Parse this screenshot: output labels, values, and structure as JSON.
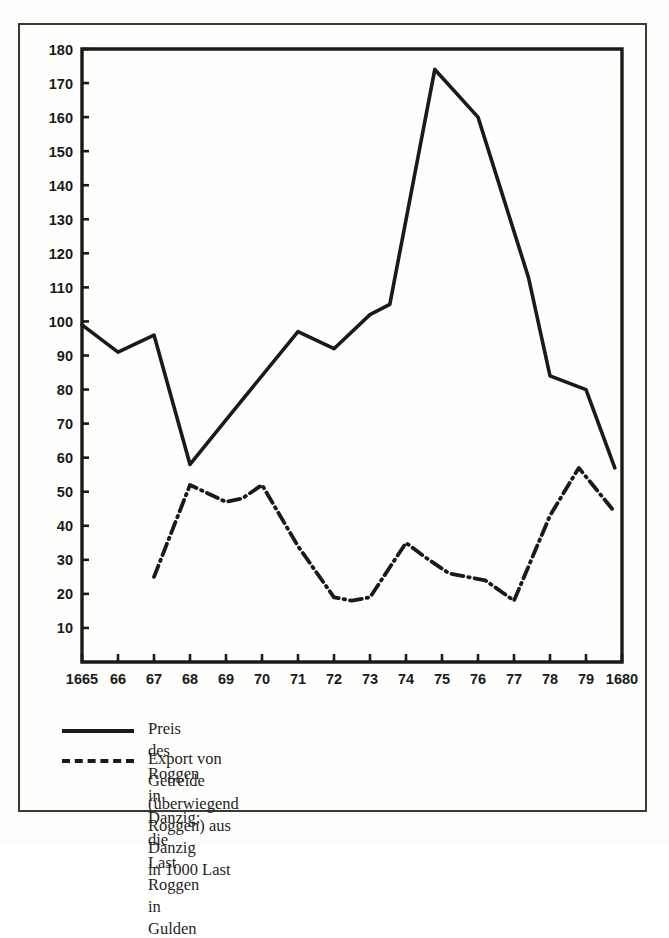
{
  "figure": {
    "background_color": "#fdfdfb",
    "frame_color": "#3a3a36",
    "ink_color": "#1a1a18"
  },
  "legend": {
    "position": "below-axes",
    "entries": [
      {
        "style": "solid",
        "label": "Preis des Roggen in Danzig; die Last Roggen in Gulden"
      },
      {
        "style": "dash-dot",
        "label": "Export von Getreide (überwiegend Roggen) aus Danzig\nin 1000 Last"
      }
    ]
  },
  "chart_data": {
    "type": "line",
    "title": "",
    "subtitle": "",
    "xlabel": "",
    "ylabel": "",
    "grid": false,
    "legend_position": "bottom",
    "xlim": [
      1665,
      1680
    ],
    "ylim": [
      0,
      180
    ],
    "y_ticks": [
      10,
      20,
      30,
      40,
      50,
      60,
      70,
      80,
      90,
      100,
      110,
      120,
      130,
      140,
      150,
      160,
      170,
      180
    ],
    "y_tick_labels": [
      "10",
      "20",
      "30",
      "40",
      "50",
      "60",
      "70",
      "80",
      "90",
      "100",
      "110",
      "120",
      "130",
      "140",
      "150",
      "160",
      "170",
      "180"
    ],
    "x_ticks": [
      1665,
      1666,
      1667,
      1668,
      1669,
      1670,
      1671,
      1672,
      1673,
      1674,
      1675,
      1676,
      1677,
      1678,
      1679,
      1680
    ],
    "x_tick_labels": [
      "1665",
      "66",
      "67",
      "68",
      "69",
      "70",
      "71",
      "72",
      "73",
      "74",
      "75",
      "76",
      "77",
      "78",
      "79",
      "1680"
    ],
    "series": [
      {
        "name": "Preis des Roggen in Danzig; die Last Roggen in Gulden",
        "style": "solid",
        "unit": "Gulden",
        "x": [
          1665.0,
          1666.0,
          1667.0,
          1668.0,
          1669.3,
          1671.0,
          1672.0,
          1673.0,
          1673.55,
          1674.8,
          1676.0,
          1677.4,
          1678.0,
          1679.0,
          1679.8
        ],
        "values": [
          99,
          91,
          96,
          58,
          75,
          97,
          92,
          102,
          105,
          174,
          160,
          113,
          84,
          80,
          57
        ]
      },
      {
        "name": "Export von Getreide (überwiegend Roggen) aus Danzig in 1000 Last",
        "style": "dash-dot",
        "unit": "1000 Last",
        "x": [
          1667.0,
          1668.0,
          1669.0,
          1669.45,
          1670.0,
          1671.0,
          1672.0,
          1672.5,
          1673.0,
          1674.0,
          1674.5,
          1675.2,
          1676.2,
          1677.0,
          1678.0,
          1678.8,
          1679.8
        ],
        "values": [
          25,
          52,
          47,
          48,
          52,
          34,
          19,
          18,
          19,
          35,
          31,
          26,
          24,
          18,
          43,
          57,
          44
        ]
      }
    ]
  }
}
